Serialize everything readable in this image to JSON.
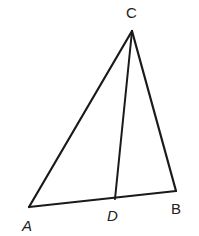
{
  "figure": {
    "type": "triangle-with-cevian",
    "stroke_color": "#1a1a1a",
    "points": {
      "A": {
        "x": 29,
        "y": 207
      },
      "B": {
        "x": 176,
        "y": 191
      },
      "C": {
        "x": 132,
        "y": 31
      },
      "D": {
        "x": 115,
        "y": 199
      }
    },
    "segments": [
      {
        "name": "AC",
        "from": "A",
        "to": "C"
      },
      {
        "name": "CB",
        "from": "C",
        "to": "B"
      },
      {
        "name": "AB",
        "from": "A",
        "to": "B"
      },
      {
        "name": "CD",
        "from": "C",
        "to": "D"
      }
    ],
    "labels": {
      "A": {
        "text": "A",
        "x": 22,
        "y": 218,
        "italic": true
      },
      "B": {
        "text": "B",
        "x": 171,
        "y": 201,
        "italic": false
      },
      "C": {
        "text": "C",
        "x": 126,
        "y": 5,
        "italic": false
      },
      "D": {
        "text": "D",
        "x": 107,
        "y": 208,
        "italic": true
      }
    }
  }
}
